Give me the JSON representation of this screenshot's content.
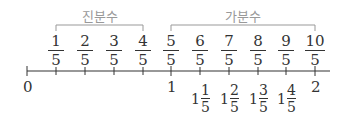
{
  "groups": [
    {
      "label": "진분수",
      "from": "1/5",
      "to": "4/5"
    },
    {
      "label": "가분수",
      "from": "5/5",
      "to": "10/5"
    }
  ],
  "fractions": [
    {
      "num": "1",
      "den": "5"
    },
    {
      "num": "2",
      "den": "5"
    },
    {
      "num": "3",
      "den": "5"
    },
    {
      "num": "4",
      "den": "5"
    },
    {
      "num": "5",
      "den": "5"
    },
    {
      "num": "6",
      "den": "5"
    },
    {
      "num": "7",
      "den": "5"
    },
    {
      "num": "8",
      "den": "5"
    },
    {
      "num": "9",
      "den": "5"
    },
    {
      "num": "10",
      "den": "5"
    }
  ],
  "axis_labels": {
    "zero": "0",
    "one": "1",
    "two": "2"
  },
  "mixed_numbers": [
    {
      "whole": "1",
      "num": "1",
      "den": "5"
    },
    {
      "whole": "1",
      "num": "2",
      "den": "5"
    },
    {
      "whole": "1",
      "num": "3",
      "den": "5"
    },
    {
      "whole": "1",
      "num": "4",
      "den": "5"
    }
  ],
  "colors": {
    "line": "#333333",
    "group_label": "#999999",
    "bracket": "#999999"
  }
}
